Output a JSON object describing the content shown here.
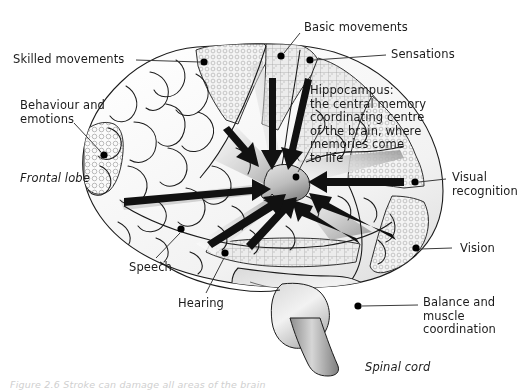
{
  "figure": {
    "caption": "Figure 2.6 Stroke can damage all areas of the brain",
    "background_color": "#ffffff",
    "ink_color": "#1b1b1b",
    "brain_fill": "#f7f7f7",
    "shade_gray": "#9a9a9a",
    "arrow_color": "#111111",
    "dot_color": "#000000"
  },
  "labels": {
    "skilled_movements": "Skilled movements",
    "behaviour_and_emotions": "Behaviour and\nemotions",
    "frontal_lobe": "Frontal lobe",
    "basic_movements": "Basic movements",
    "sensations": "Sensations",
    "hippocampus": "Hippocampus:\nthe central memory\ncoordinating centre\nof the brain, where\nmemories come\nto life",
    "visual_recognition": "Visual\nrecognition",
    "vision": "Vision",
    "balance_and_muscle_coordination": "Balance and\nmuscle\ncoordination",
    "spinal_cord": "Spinal cord",
    "speech": "Speech",
    "hearing": "Hearing"
  },
  "callouts": [
    {
      "name": "skilled-movements",
      "label": "Skilled movements",
      "side": "left",
      "dot": [
        205,
        63
      ],
      "text_xy": [
        13,
        53
      ]
    },
    {
      "name": "behaviour-and-emotions",
      "label": "Behaviour and emotions",
      "side": "left",
      "dot": [
        104,
        155
      ],
      "text_xy": [
        20,
        100
      ]
    },
    {
      "name": "frontal-lobe",
      "label": "Frontal lobe",
      "side": "left",
      "dot": null,
      "text_xy": [
        20,
        172
      ],
      "style": "italic"
    },
    {
      "name": "basic-movements",
      "label": "Basic movements",
      "side": "top",
      "dot": [
        281,
        56
      ],
      "text_xy": [
        304,
        22
      ]
    },
    {
      "name": "sensations",
      "label": "Sensations",
      "side": "right",
      "dot": [
        310,
        60
      ],
      "text_xy": [
        392,
        48
      ]
    },
    {
      "name": "hippocampus",
      "label": "Hippocampus",
      "side": "right",
      "dot": [
        288,
        177
      ],
      "text_xy": [
        310,
        84
      ]
    },
    {
      "name": "visual-recognition",
      "label": "Visual recognition",
      "side": "right",
      "dot": [
        415,
        182
      ],
      "text_xy": [
        452,
        172
      ]
    },
    {
      "name": "vision",
      "label": "Vision",
      "side": "right",
      "dot": [
        416,
        248
      ],
      "text_xy": [
        460,
        243
      ]
    },
    {
      "name": "balance-and-muscle-coordination",
      "label": "Balance and muscle coordination",
      "side": "right",
      "dot": [
        358,
        306
      ],
      "text_xy": [
        424,
        297
      ]
    },
    {
      "name": "spinal-cord",
      "label": "Spinal cord",
      "side": "bottom",
      "dot": null,
      "text_xy": [
        366,
        362
      ],
      "style": "italic"
    },
    {
      "name": "speech",
      "label": "Speech",
      "side": "bottom-left",
      "dot": [
        181,
        229
      ],
      "text_xy": [
        129,
        262
      ]
    },
    {
      "name": "hearing",
      "label": "Hearing",
      "side": "bottom-left",
      "dot": [
        225,
        253
      ],
      "text_xy": [
        178,
        298
      ]
    }
  ],
  "hippocampus_arrows": {
    "count": 8,
    "description": "Arrows converging from surrounding cortical regions onto the hippocampus",
    "target": [
      283,
      184
    ]
  }
}
